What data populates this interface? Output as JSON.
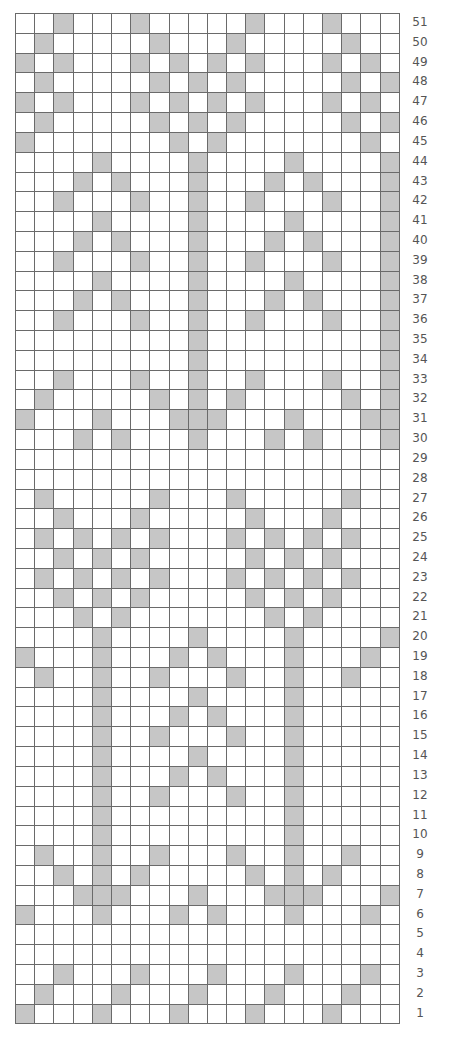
{
  "chart_data": {
    "type": "heatmap",
    "title": "",
    "columns": 20,
    "rows": 51,
    "row_label_position": "right",
    "row_order": "top-to-bottom",
    "colors": {
      "filled": "#c6c6c6",
      "empty": "#ffffff",
      "grid": "#6a6a6a",
      "label": "#555555"
    },
    "row_labels": [
      "51",
      "50",
      "49",
      "48",
      "47",
      "46",
      "45",
      "44",
      "43",
      "42",
      "41",
      "40",
      "39",
      "38",
      "37",
      "36",
      "35",
      "34",
      "33",
      "32",
      "31",
      "30",
      "29",
      "28",
      "27",
      "26",
      "25",
      "24",
      "23",
      "22",
      "21",
      "20",
      "19",
      "18",
      "17",
      "16",
      "15",
      "14",
      "13",
      "12",
      "11",
      "10",
      "9",
      "8",
      "7",
      "6",
      "5",
      "4",
      "3",
      "2",
      "1"
    ],
    "filled_cells_by_row": {
      "51": [
        3,
        7,
        13,
        17
      ],
      "50": [
        2,
        8,
        12,
        18
      ],
      "49": [
        1,
        3,
        7,
        9,
        11,
        13,
        17,
        19
      ],
      "48": [
        2,
        8,
        10,
        12,
        18,
        20
      ],
      "47": [
        1,
        3,
        7,
        9,
        11,
        13,
        17,
        19
      ],
      "46": [
        2,
        8,
        10,
        12,
        18,
        20
      ],
      "45": [
        1,
        9,
        11,
        19
      ],
      "44": [
        5,
        10,
        15,
        20
      ],
      "43": [
        4,
        6,
        10,
        14,
        16,
        20
      ],
      "42": [
        3,
        7,
        10,
        13,
        17,
        20
      ],
      "41": [
        5,
        10,
        15,
        20
      ],
      "40": [
        4,
        6,
        10,
        14,
        16,
        20
      ],
      "39": [
        3,
        7,
        10,
        13,
        17,
        20
      ],
      "38": [
        5,
        10,
        15,
        20
      ],
      "37": [
        4,
        6,
        10,
        14,
        16,
        20
      ],
      "36": [
        3,
        7,
        10,
        13,
        17,
        20
      ],
      "35": [
        10,
        20
      ],
      "34": [
        10,
        20
      ],
      "33": [
        3,
        7,
        10,
        13,
        17,
        20
      ],
      "32": [
        2,
        8,
        10,
        12,
        18,
        20
      ],
      "31": [
        1,
        5,
        9,
        10,
        11,
        15,
        19,
        20
      ],
      "30": [
        4,
        6,
        10,
        14,
        16,
        20
      ],
      "29": [],
      "28": [],
      "27": [
        2,
        8,
        12,
        18
      ],
      "26": [
        3,
        7,
        13,
        17
      ],
      "25": [
        2,
        4,
        6,
        8,
        12,
        14,
        16,
        18
      ],
      "24": [
        3,
        5,
        7,
        13,
        15,
        17
      ],
      "23": [
        2,
        4,
        6,
        8,
        12,
        14,
        16,
        18
      ],
      "22": [
        3,
        5,
        7,
        13,
        15,
        17
      ],
      "21": [
        4,
        6,
        14,
        16
      ],
      "20": [
        5,
        10,
        15,
        20
      ],
      "19": [
        1,
        5,
        9,
        11,
        15,
        19
      ],
      "18": [
        2,
        5,
        8,
        12,
        15,
        18
      ],
      "17": [
        5,
        10,
        15
      ],
      "16": [
        5,
        9,
        11,
        15
      ],
      "15": [
        5,
        8,
        12,
        15
      ],
      "14": [
        5,
        10,
        15
      ],
      "13": [
        5,
        9,
        11,
        15
      ],
      "12": [
        5,
        8,
        12,
        15
      ],
      "11": [
        5,
        15
      ],
      "10": [
        5,
        15
      ],
      "9": [
        2,
        5,
        8,
        12,
        15,
        18
      ],
      "8": [
        3,
        5,
        7,
        13,
        15,
        17
      ],
      "7": [
        4,
        5,
        6,
        10,
        14,
        15,
        16,
        20
      ],
      "6": [
        1,
        5,
        9,
        11,
        15,
        19
      ],
      "5": [],
      "4": [],
      "3": [
        3,
        7,
        11,
        15,
        19
      ],
      "2": [
        2,
        6,
        10,
        14,
        18
      ],
      "1": [
        1,
        5,
        9,
        13,
        17
      ]
    }
  }
}
